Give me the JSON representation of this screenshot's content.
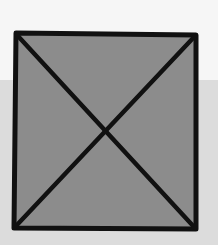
{
  "image": {
    "kind": "placeholder-box",
    "description": "hand-drawn box with X (image placeholder)",
    "colors": {
      "fill": "#8c8c8c",
      "stroke": "#111111",
      "background_top": "#f6f6f6",
      "background_bottom": "#dcdcdc"
    }
  }
}
